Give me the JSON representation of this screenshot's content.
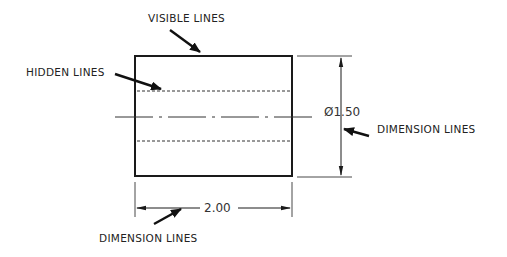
{
  "diagram": {
    "type": "engineering-drawing",
    "colors": {
      "line": "#1a1a1a",
      "text": "#222222",
      "background": "#ffffff"
    },
    "labels": {
      "visible_lines": "VISIBLE LINES",
      "hidden_lines": "HIDDEN LINES",
      "dimension_lines_right": "DIMENSION LINES",
      "dimension_lines_bottom": "DIMENSION LINES"
    },
    "dimensions": {
      "diameter": "Ø1.50",
      "length": "2.00"
    },
    "part": {
      "view": "side view of cylinder",
      "features": [
        "visible outline",
        "hidden bore lines",
        "center line"
      ]
    }
  }
}
